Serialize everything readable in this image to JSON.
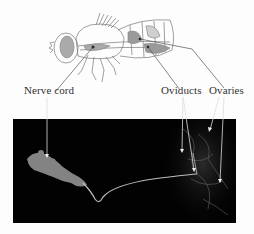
{
  "figure": {
    "labels": {
      "nerve_cord": "Nerve cord",
      "oviducts": "Oviducts",
      "ovaries": "Ovaries"
    },
    "illustration": "drosophila-side-view",
    "micrograph": "fluorescence-image-nerve-cord-to-reproductive-tract",
    "colors": {
      "background": "#fdfdfd",
      "panel": "#020202",
      "line": "#555555",
      "pointer": "#e8e8e8",
      "organ_fill": "#9a9a9a"
    }
  }
}
